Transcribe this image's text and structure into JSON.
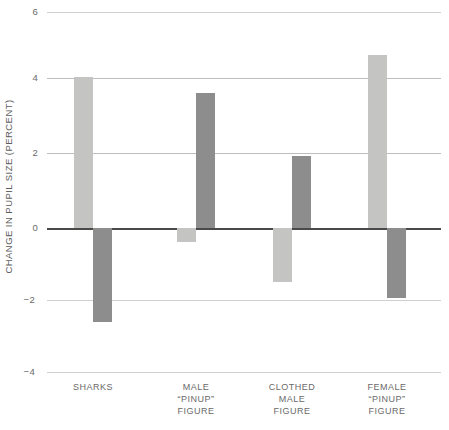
{
  "chart_data": {
    "type": "bar",
    "title": "",
    "subtitle": "",
    "xlabel": "",
    "ylabel": "CHANGE IN PUPIL SIZE (PERCENT)",
    "ylim": [
      -4,
      6
    ],
    "yticks": [
      6,
      4,
      2,
      0,
      -2,
      -4
    ],
    "ytick_labels": [
      "6",
      "4",
      "2",
      "0",
      "−2",
      "−4"
    ],
    "grid": true,
    "legend": "none",
    "legend_position": "none",
    "zero_line": 0,
    "categories": [
      "SHARKS",
      "MALE “PINUP” FIGURE",
      "CLOTHED MALE FIGURE",
      "FEMALE “PINUP” FIGURE"
    ],
    "series": [
      {
        "name": "light-bar",
        "color": "#c4c4c2",
        "values": [
          4.2,
          -0.4,
          -1.5,
          4.8
        ]
      },
      {
        "name": "dark-bar",
        "color": "#8d8d8d",
        "values": [
          -2.6,
          3.75,
          2.0,
          -1.95
        ]
      }
    ]
  },
  "axis": {
    "y_title": "CHANGE IN PUPIL SIZE (PERCENT)",
    "ticks": [
      {
        "value": 6,
        "label": "6"
      },
      {
        "value": 4,
        "label": "4"
      },
      {
        "value": 2,
        "label": "2"
      },
      {
        "value": 0,
        "label": "0"
      },
      {
        "value": -2,
        "label": "−2"
      },
      {
        "value": -4,
        "label": "−4"
      }
    ]
  },
  "groups": [
    {
      "id": "sharks",
      "label_lines": [
        "SHARKS",
        "",
        ""
      ],
      "light_value": 4.2,
      "dark_value": -2.6
    },
    {
      "id": "male-pinup-figure",
      "label_lines": [
        "MALE",
        "“PINUP”",
        "FIGURE"
      ],
      "light_value": -0.4,
      "dark_value": 3.75
    },
    {
      "id": "clothed-male-figure",
      "label_lines": [
        "CLOTHED",
        "MALE",
        "FIGURE"
      ],
      "light_value": -1.5,
      "dark_value": 2.0
    },
    {
      "id": "female-pinup-figure",
      "label_lines": [
        "FEMALE",
        "“PINUP”",
        "FIGURE"
      ],
      "light_value": 4.8,
      "dark_value": -1.95
    }
  ],
  "colors": {
    "light_bar": "#c4c4c2",
    "dark_bar": "#8d8d8d",
    "gridline": "#bdbdbd",
    "zero_line": "#4a4a4a",
    "text": "#6a6a6a",
    "background": "#ffffff"
  }
}
